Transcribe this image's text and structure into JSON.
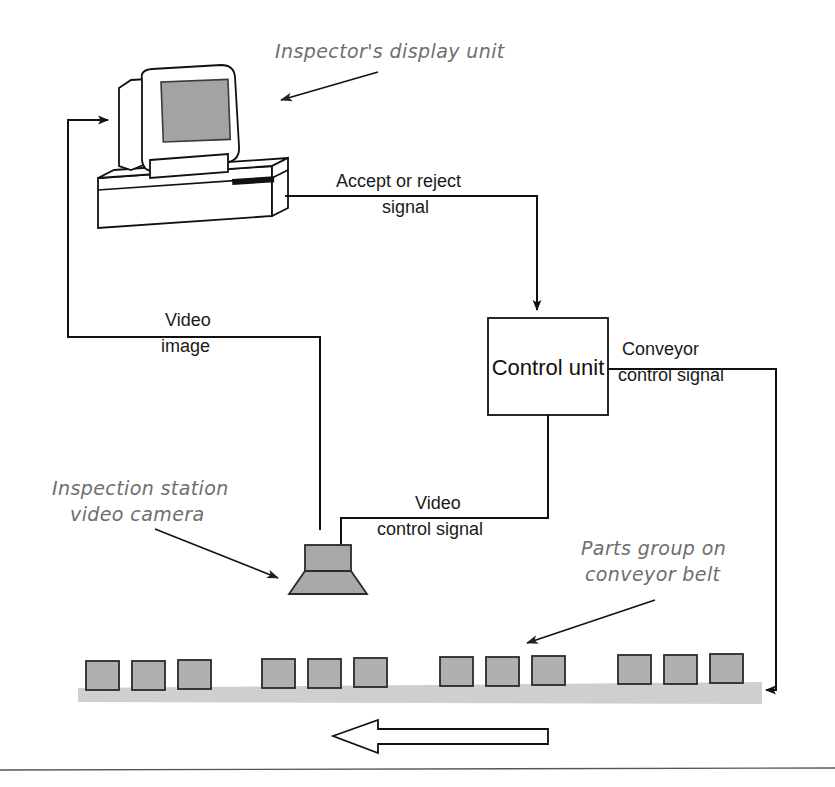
{
  "diagram": {
    "nodes": {
      "display_unit": {
        "label": "Inspector's display unit",
        "screen_color": "#a3a3a3",
        "case_color": "#ffffff"
      },
      "control_unit": {
        "label": "Control unit",
        "fill": "#ffffff",
        "stroke": "#111111"
      },
      "camera": {
        "label_line1": "Inspection station",
        "label_line2": "video camera",
        "body_color": "#a8a8a8",
        "lens_color": "#a8a8a8"
      },
      "conveyor": {
        "label_line1": "Parts group on",
        "label_line2": "conveyor belt",
        "belt_color": "#cfcfcf",
        "part_color": "#b0b0b0",
        "part_count": 12,
        "group_count": 4,
        "parts_per_group": 3,
        "direction": "right-to-left"
      }
    },
    "signals": [
      {
        "name": "accept-or-reject-signal",
        "line1": "Accept or reject",
        "line2": "signal",
        "from": "display_unit",
        "to": "control_unit"
      },
      {
        "name": "video-image",
        "line1": "Video",
        "line2": "image",
        "from": "camera",
        "to": "display_unit"
      },
      {
        "name": "video-control-signal",
        "line1": "Video",
        "line2": "control signal",
        "from": "control_unit",
        "to": "camera"
      },
      {
        "name": "conveyor-control-signal",
        "line1": "Conveyor",
        "line2": "control signal",
        "from": "control_unit",
        "to": "conveyor"
      }
    ],
    "colors": {
      "ink": "#111111",
      "hand_label": "#6e6e6e",
      "belt_gray": "#cfcfcf",
      "part_gray": "#b0b0b0",
      "screen_gray": "#a3a3a3",
      "rule": "#555555"
    }
  }
}
